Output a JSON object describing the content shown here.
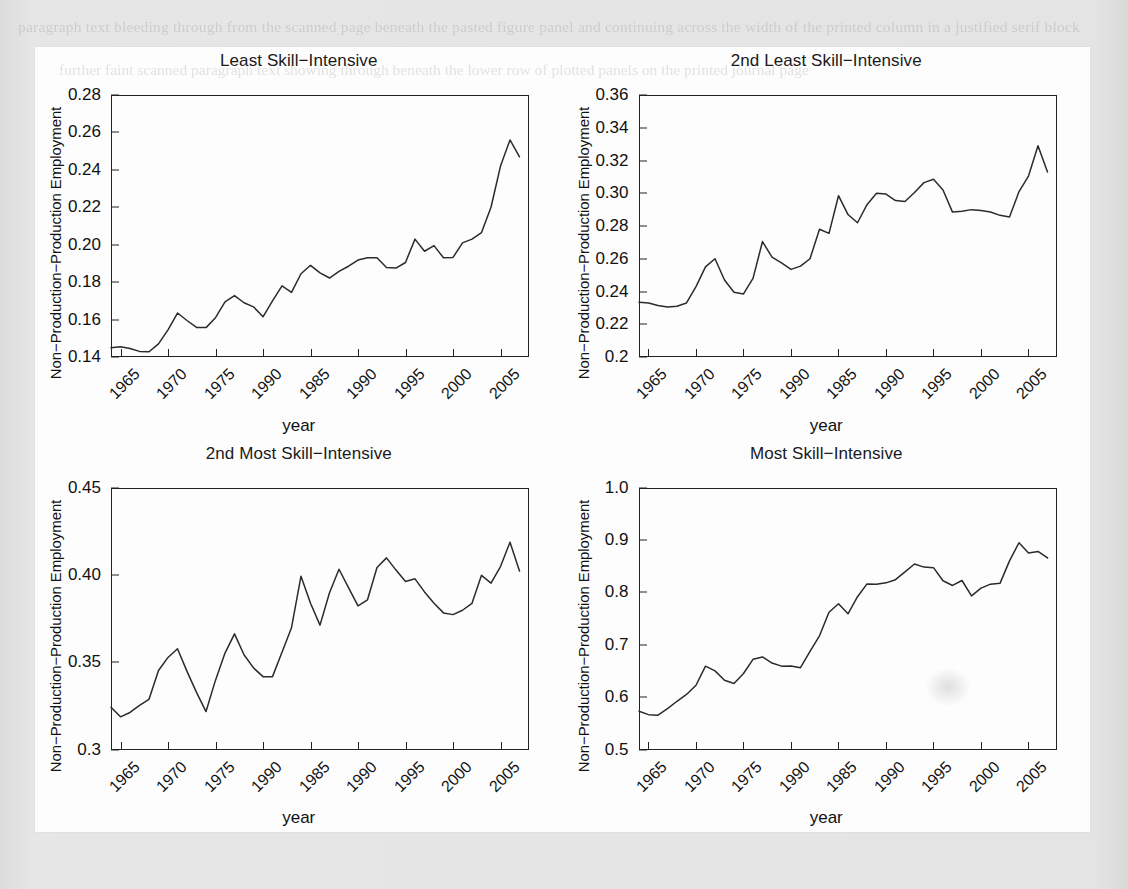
{
  "page": {
    "background_color": "#e3e3e3",
    "figure_panel_color": "#fdfdfd",
    "line_color": "#2b2b2b",
    "axis_color": "#222222",
    "ghost_text_top": "paragraph text bleeding through from the scanned page beneath the pasted figure panel and continuing across the width of the printed column in a justified serif block",
    "ghost_text_bottom": "further faint scanned paragraph text showing through beneath the lower row of plotted panels on the printed journal page"
  },
  "figure": {
    "y_axis_label": "Non−Production−Production Employment",
    "x_axis_label": "year",
    "x_tick_labels": [
      "1965",
      "1970",
      "1975",
      "1990",
      "1985",
      "1990",
      "1995",
      "2000",
      "2005"
    ]
  },
  "chart_data": [
    {
      "type": "line",
      "title": "Least Skill−Intensive",
      "xlabel": "year",
      "ylabel": "Non−Production−Production Employment",
      "xlim": [
        1964,
        2008
      ],
      "ylim": [
        0.14,
        0.28
      ],
      "yticks": [
        0.14,
        0.16,
        0.18,
        0.2,
        0.22,
        0.24,
        0.26,
        0.28
      ],
      "ytick_labels": [
        "0.14",
        "0.16",
        "0.18",
        "0.20",
        "0.22",
        "0.24",
        "0.26",
        "0.28"
      ],
      "xticks": [
        1965,
        1970,
        1975,
        1980,
        1985,
        1990,
        1995,
        2000,
        2005
      ],
      "grid": false,
      "legend": "none",
      "x": [
        1964,
        1965,
        1966,
        1967,
        1968,
        1969,
        1970,
        1971,
        1972,
        1973,
        1974,
        1975,
        1976,
        1977,
        1978,
        1979,
        1980,
        1981,
        1982,
        1983,
        1984,
        1985,
        1986,
        1987,
        1988,
        1989,
        1990,
        1991,
        1992,
        1993,
        1994,
        1995,
        1996,
        1997,
        1998,
        1999,
        2000,
        2001,
        2002,
        2003,
        2004,
        2005,
        2006,
        2007
      ],
      "y": [
        0.145,
        0.1455,
        0.1445,
        0.143,
        0.1428,
        0.147,
        0.1545,
        0.1635,
        0.1595,
        0.1558,
        0.1557,
        0.161,
        0.1695,
        0.1728,
        0.169,
        0.1668,
        0.1615,
        0.17,
        0.178,
        0.1745,
        0.1845,
        0.189,
        0.185,
        0.1822,
        0.1858,
        0.1885,
        0.1918,
        0.193,
        0.193,
        0.1878,
        0.1875,
        0.1905,
        0.203,
        0.1965,
        0.1995,
        0.193,
        0.1932,
        0.201,
        0.203,
        0.2065,
        0.22,
        0.242,
        0.256,
        0.247,
        0.2615,
        0.259
      ]
    },
    {
      "type": "line",
      "title": "2nd Least Skill−Intensive",
      "xlabel": "year",
      "ylabel": "Non−Production−Production Employment",
      "xlim": [
        1964,
        2008
      ],
      "ylim": [
        0.2,
        0.36
      ],
      "yticks": [
        0.2,
        0.22,
        0.24,
        0.26,
        0.28,
        0.3,
        0.32,
        0.34,
        0.36
      ],
      "ytick_labels": [
        "0.2",
        "0.22",
        "0.24",
        "0.26",
        "0.28",
        "0.30",
        "0.32",
        "0.34",
        "0.36"
      ],
      "xticks": [
        1965,
        1970,
        1975,
        1980,
        1985,
        1990,
        1995,
        2000,
        2005
      ],
      "grid": false,
      "legend": "none",
      "x": [
        1964,
        1965,
        1966,
        1967,
        1968,
        1969,
        1970,
        1971,
        1972,
        1973,
        1974,
        1975,
        1976,
        1977,
        1978,
        1979,
        1980,
        1981,
        1982,
        1983,
        1984,
        1985,
        1986,
        1987,
        1988,
        1989,
        1990,
        1991,
        1992,
        1993,
        1994,
        1995,
        1996,
        1997,
        1998,
        1999,
        2000,
        2001,
        2002,
        2003,
        2004,
        2005,
        2006,
        2007
      ],
      "y": [
        0.2335,
        0.233,
        0.2315,
        0.2305,
        0.231,
        0.233,
        0.243,
        0.255,
        0.26,
        0.247,
        0.2395,
        0.2385,
        0.248,
        0.2705,
        0.261,
        0.2575,
        0.2535,
        0.2555,
        0.26,
        0.278,
        0.2755,
        0.2985,
        0.287,
        0.282,
        0.293,
        0.3,
        0.2995,
        0.2955,
        0.295,
        0.3005,
        0.3065,
        0.3085,
        0.302,
        0.2885,
        0.289,
        0.29,
        0.2895,
        0.2885,
        0.2865,
        0.2855,
        0.301,
        0.3105,
        0.329,
        0.313,
        0.323,
        0.3455
      ]
    },
    {
      "type": "line",
      "title": "2nd Most Skill−Intensive",
      "xlabel": "year",
      "ylabel": "Non−Production−Production Employment",
      "xlim": [
        1964,
        2008
      ],
      "ylim": [
        0.3,
        0.45
      ],
      "yticks": [
        0.3,
        0.35,
        0.4,
        0.45
      ],
      "ytick_labels": [
        "0.3",
        "0.35",
        "0.40",
        "0.45"
      ],
      "xticks": [
        1965,
        1970,
        1975,
        1980,
        1985,
        1990,
        1995,
        2000,
        2005
      ],
      "grid": false,
      "legend": "none",
      "x": [
        1964,
        1965,
        1966,
        1967,
        1968,
        1969,
        1970,
        1971,
        1972,
        1973,
        1974,
        1975,
        1976,
        1977,
        1978,
        1979,
        1980,
        1981,
        1982,
        1983,
        1984,
        1985,
        1986,
        1987,
        1988,
        1989,
        1990,
        1991,
        1992,
        1993,
        1994,
        1995,
        1996,
        1997,
        1998,
        1999,
        2000,
        2001,
        2002,
        2003,
        2004,
        2005,
        2006,
        2007
      ],
      "y": [
        0.3245,
        0.319,
        0.3215,
        0.3255,
        0.329,
        0.3455,
        0.353,
        0.358,
        0.345,
        0.333,
        0.322,
        0.34,
        0.3555,
        0.3665,
        0.3545,
        0.347,
        0.342,
        0.342,
        0.356,
        0.37,
        0.3995,
        0.384,
        0.3715,
        0.39,
        0.4035,
        0.393,
        0.3825,
        0.386,
        0.4045,
        0.41,
        0.403,
        0.3965,
        0.398,
        0.3905,
        0.384,
        0.3785,
        0.3775,
        0.38,
        0.384,
        0.4,
        0.3955,
        0.405,
        0.419,
        0.4025,
        0.433,
        0.4355,
        0.4475
      ]
    },
    {
      "type": "line",
      "title": "Most Skill−Intensive",
      "xlabel": "year",
      "ylabel": "Non−Production−Production Employment",
      "xlim": [
        1964,
        2008
      ],
      "ylim": [
        0.5,
        1.0
      ],
      "yticks": [
        0.5,
        0.6,
        0.7,
        0.8,
        0.9,
        1.0
      ],
      "ytick_labels": [
        "0.5",
        "0.6",
        "0.7",
        "0.8",
        "0.9",
        "1.0"
      ],
      "xticks": [
        1965,
        1970,
        1975,
        1980,
        1985,
        1990,
        1995,
        2000,
        2005
      ],
      "grid": false,
      "legend": "none",
      "x": [
        1964,
        1965,
        1966,
        1967,
        1968,
        1969,
        1970,
        1971,
        1972,
        1973,
        1974,
        1975,
        1976,
        1977,
        1978,
        1979,
        1980,
        1981,
        1982,
        1983,
        1984,
        1985,
        1986,
        1987,
        1988,
        1989,
        1990,
        1991,
        1992,
        1993,
        1994,
        1995,
        1996,
        1997,
        1998,
        1999,
        2000,
        2001,
        2002,
        2003,
        2004,
        2005,
        2006,
        2007
      ],
      "y": [
        0.574,
        0.5675,
        0.5665,
        0.579,
        0.593,
        0.606,
        0.6235,
        0.66,
        0.651,
        0.633,
        0.627,
        0.646,
        0.673,
        0.6775,
        0.666,
        0.66,
        0.6605,
        0.657,
        0.688,
        0.718,
        0.763,
        0.779,
        0.76,
        0.7925,
        0.817,
        0.8165,
        0.819,
        0.825,
        0.84,
        0.855,
        0.849,
        0.848,
        0.823,
        0.814,
        0.8235,
        0.794,
        0.809,
        0.8165,
        0.818,
        0.861,
        0.8955,
        0.876,
        0.879,
        0.8665,
        0.835,
        0.8205,
        0.872
      ]
    }
  ]
}
